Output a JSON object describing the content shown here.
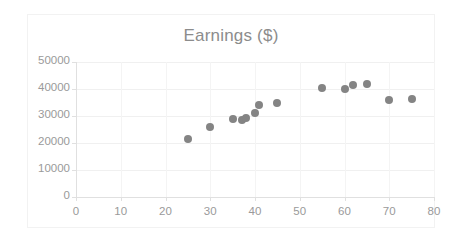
{
  "chart": {
    "title": "Earnings ($)",
    "marker_color": "#848484",
    "axis_color": "#9a9a9a",
    "grid_color": "#f0f0f0",
    "title_color": "#8c8c8c"
  },
  "chart_data": {
    "type": "scatter",
    "title": "Earnings ($)",
    "xlabel": "",
    "ylabel": "",
    "xlim": [
      0,
      80
    ],
    "ylim": [
      0,
      50000
    ],
    "xticks": [
      0,
      10,
      20,
      30,
      40,
      50,
      60,
      70,
      80
    ],
    "yticks": [
      0,
      10000,
      20000,
      30000,
      40000,
      50000
    ],
    "xtick_labels": [
      "0",
      "10",
      "20",
      "30",
      "40",
      "50",
      "60",
      "70",
      "80"
    ],
    "ytick_labels": [
      "0",
      "10000",
      "20000",
      "30000",
      "40000",
      "50000"
    ],
    "grid": true,
    "legend": false,
    "series": [
      {
        "name": "Earnings",
        "color": "#848484",
        "points": [
          {
            "x": 25,
            "y": 21500
          },
          {
            "x": 30,
            "y": 26000
          },
          {
            "x": 35,
            "y": 29000
          },
          {
            "x": 37,
            "y": 28500
          },
          {
            "x": 38,
            "y": 29300
          },
          {
            "x": 40,
            "y": 31000
          },
          {
            "x": 41,
            "y": 34000
          },
          {
            "x": 45,
            "y": 35000
          },
          {
            "x": 55,
            "y": 40200
          },
          {
            "x": 60,
            "y": 40000
          },
          {
            "x": 62,
            "y": 41500
          },
          {
            "x": 65,
            "y": 42000
          },
          {
            "x": 70,
            "y": 36000
          },
          {
            "x": 75,
            "y": 36300
          }
        ]
      }
    ]
  }
}
